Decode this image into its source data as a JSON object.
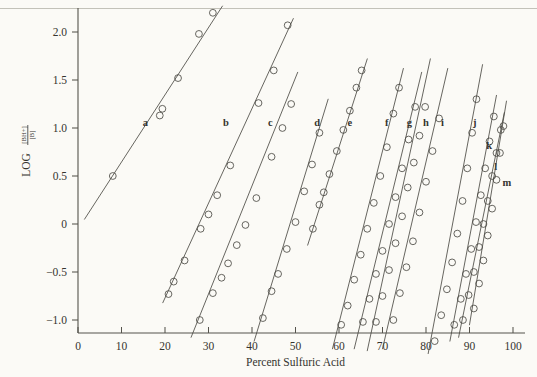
{
  "figure": {
    "background_color": "#fbfaf6",
    "ink_color": "#4b4a45"
  },
  "axes": {
    "x_title": "Percent Sulfuric Acid",
    "y_title_prefix": "LOG",
    "y_title_numerator": "[BH+]",
    "y_title_denominator": "[B]",
    "x_ticks": [
      "0",
      "10",
      "20",
      "30",
      "40",
      "50",
      "60",
      "70",
      "80",
      "90",
      "100"
    ],
    "y_ticks": [
      "2.0",
      "1.5",
      "1.0",
      "0.5",
      "0",
      "−0.5",
      "−1.0"
    ]
  },
  "chart_data": {
    "type": "scatter",
    "title": "",
    "xlabel": "Percent Sulfuric Acid",
    "ylabel": "LOG [BH+]/[B]",
    "xlim": [
      0,
      100
    ],
    "ylim": [
      -1.35,
      2.35
    ],
    "grid": false,
    "legend": "inline-labels",
    "marker": "open-circle",
    "series": [
      {
        "name": "a",
        "label_x": 15.5,
        "label_y": 1.06,
        "line": [
          [
            1.5,
            0.05
          ],
          [
            33.2,
            2.27
          ]
        ],
        "x": [
          8.0,
          18.8,
          19.4,
          23.0,
          27.8,
          31.0
        ],
        "y": [
          0.5,
          1.13,
          1.2,
          1.52,
          1.98,
          2.2
        ]
      },
      {
        "name": "b",
        "label_x": 34.0,
        "label_y": 1.06,
        "line": [
          [
            19.5,
            -0.82
          ],
          [
            49.5,
            2.14
          ]
        ],
        "x": [
          22.0,
          24.5,
          28.2,
          30.0,
          32.0,
          35.0,
          41.5,
          45.0,
          48.2
        ],
        "y": [
          -0.6,
          -0.38,
          -0.05,
          0.1,
          0.3,
          0.61,
          1.26,
          1.6,
          2.07
        ],
        "extra_x": [
          20.8
        ],
        "extra_y": [
          -0.73
        ]
      },
      {
        "name": "c",
        "label_x": 44.2,
        "label_y": 1.06,
        "line": [
          [
            26.0,
            -1.18
          ],
          [
            50.5,
            1.58
          ]
        ],
        "x": [
          28.0,
          31.0,
          33.0,
          34.5,
          36.5,
          38.5,
          41.0,
          44.5,
          47.0,
          49.0
        ],
        "y": [
          -1.0,
          -0.72,
          -0.56,
          -0.41,
          -0.22,
          -0.01,
          0.27,
          0.7,
          1.0,
          1.25
        ]
      },
      {
        "name": "d",
        "label_x": 55.0,
        "label_y": 1.06,
        "line": [
          [
            40.5,
            -1.22
          ],
          [
            57.5,
            1.3
          ]
        ],
        "x": [
          42.5,
          44.5,
          46.0,
          48.0,
          50.0,
          52.0,
          53.8,
          55.5
        ],
        "y": [
          -0.98,
          -0.7,
          -0.52,
          -0.26,
          0.02,
          0.34,
          0.62,
          0.95
        ]
      },
      {
        "name": "e",
        "label_x": 62.5,
        "label_y": 1.06,
        "line": [
          [
            52.8,
            -0.22
          ],
          [
            66.5,
            1.72
          ]
        ],
        "x": [
          54.0,
          55.5,
          56.5,
          57.8,
          59.5,
          61.0,
          62.5,
          64.0,
          65.2
        ],
        "y": [
          -0.05,
          0.2,
          0.33,
          0.52,
          0.76,
          0.98,
          1.18,
          1.42,
          1.6
        ]
      },
      {
        "name": "f",
        "label_x": 71.0,
        "label_y": 1.06,
        "line": [
          [
            58.5,
            -1.3
          ],
          [
            74.8,
            1.62
          ]
        ],
        "x": [
          60.5,
          62.0,
          63.5,
          65.0,
          66.5,
          68.0,
          69.5,
          71.0,
          72.5,
          73.8
        ],
        "y": [
          -1.05,
          -0.85,
          -0.58,
          -0.32,
          -0.05,
          0.22,
          0.5,
          0.8,
          1.15,
          1.42
        ]
      },
      {
        "name": "g",
        "label_x": 76.2,
        "label_y": 1.06,
        "line": [
          [
            63.5,
            -1.3
          ],
          [
            79.0,
            1.58
          ]
        ],
        "x": [
          65.5,
          67.0,
          68.5,
          70.0,
          71.5,
          73.0,
          74.5,
          76.0,
          77.5
        ],
        "y": [
          -1.02,
          -0.78,
          -0.52,
          -0.28,
          0.0,
          0.28,
          0.58,
          0.88,
          1.22
        ]
      },
      {
        "name": "h",
        "label_x": 80.0,
        "label_y": 1.06,
        "line": [
          [
            66.5,
            -1.32
          ],
          [
            81.0,
            1.72
          ]
        ],
        "x": [
          68.5,
          70.0,
          71.5,
          73.0,
          74.5,
          75.8,
          77.2,
          78.5,
          79.8
        ],
        "y": [
          -1.02,
          -0.75,
          -0.48,
          -0.2,
          0.08,
          0.38,
          0.64,
          0.92,
          1.22
        ]
      },
      {
        "name": "i",
        "label_x": 83.8,
        "label_y": 1.06,
        "line": [
          [
            70.0,
            -1.3
          ],
          [
            85.0,
            1.62
          ]
        ],
        "x": [
          72.5,
          74.0,
          75.5,
          77.0,
          78.5,
          80.0,
          81.5,
          83.0
        ],
        "y": [
          -1.0,
          -0.72,
          -0.45,
          -0.18,
          0.12,
          0.44,
          0.76,
          1.1
        ]
      },
      {
        "name": "j",
        "label_x": 91.2,
        "label_y": 1.06,
        "line": [
          [
            80.5,
            -1.35
          ],
          [
            93.0,
            1.66
          ]
        ],
        "x": [
          82.0,
          83.5,
          84.8,
          86.0,
          87.2,
          88.4,
          89.5,
          90.6,
          91.6
        ],
        "y": [
          -1.22,
          -0.95,
          -0.68,
          -0.4,
          -0.1,
          0.24,
          0.58,
          0.95,
          1.3
        ]
      },
      {
        "name": "k",
        "label_x": 94.5,
        "label_y": 0.82,
        "line": [
          [
            85.5,
            -1.22
          ],
          [
            96.2,
            1.34
          ]
        ],
        "x": [
          86.5,
          88.0,
          89.2,
          90.4,
          91.5,
          92.6,
          93.6,
          94.6,
          95.6
        ],
        "y": [
          -1.05,
          -0.78,
          -0.52,
          -0.26,
          0.02,
          0.3,
          0.58,
          0.86,
          1.12
        ]
      },
      {
        "name": "l",
        "label_x": 96.0,
        "label_y": 0.6,
        "line": [
          [
            87.5,
            -1.18
          ],
          [
            98.0,
            1.16
          ]
        ],
        "x": [
          88.5,
          89.8,
          91.0,
          92.2,
          93.2,
          94.2,
          95.2,
          96.2,
          97.2
        ],
        "y": [
          -1.0,
          -0.74,
          -0.5,
          -0.24,
          0.0,
          0.24,
          0.5,
          0.74,
          0.98
        ]
      },
      {
        "name": "m",
        "label_x": 98.6,
        "label_y": 0.44,
        "line": [
          [
            90.0,
            -1.05
          ],
          [
            98.5,
            1.28
          ]
        ],
        "x": [
          91.0,
          92.2,
          93.2,
          94.2,
          95.2,
          96.2,
          97.0,
          97.8
        ],
        "y": [
          -0.88,
          -0.62,
          -0.38,
          -0.12,
          0.16,
          0.46,
          0.74,
          1.02
        ]
      }
    ]
  }
}
